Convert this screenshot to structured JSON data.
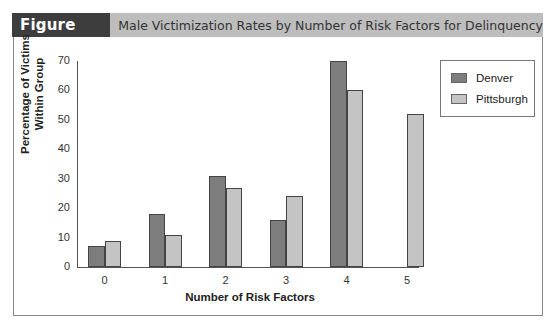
{
  "figure": {
    "label": "Figure 16.3",
    "title": "Male Victimization Rates by Number of Risk Factors for Delinquency"
  },
  "colors": {
    "denver": "#7d7d7d",
    "pittsburgh": "#c4c4c4",
    "header_bg": "#bdbdbd",
    "label_bg": "#3d3d3d"
  },
  "chart_data": {
    "type": "bar",
    "title": "Male Victimization Rates by Number of Risk Factors for Delinquency",
    "xlabel": "Number of Risk Factors",
    "ylabel": "Percentage of Victims Within Group",
    "ylabel_lines": [
      "Percentage of Victims",
      "Within Group"
    ],
    "categories": [
      "0",
      "1",
      "2",
      "3",
      "4",
      "5"
    ],
    "series": [
      {
        "name": "Denver",
        "values": [
          7,
          18,
          31,
          16,
          70,
          null
        ]
      },
      {
        "name": "Pittsburgh",
        "values": [
          9,
          11,
          27,
          24,
          60,
          52
        ]
      }
    ],
    "ylim": [
      0,
      70
    ],
    "yticks": [
      0,
      10,
      20,
      30,
      40,
      50,
      60,
      70
    ],
    "grid": false,
    "legend_position": "top-right"
  }
}
